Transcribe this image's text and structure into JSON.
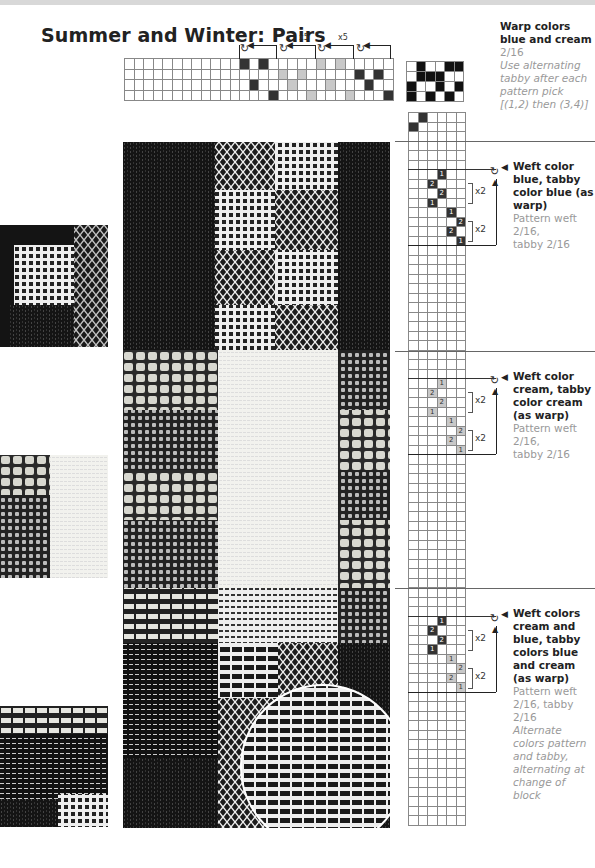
{
  "page": {
    "title": "Summer and Winter: Pairs"
  },
  "threading": {
    "repeat_labels": [
      "x5",
      "x5"
    ],
    "rows": 4,
    "columns": 28,
    "blocks": [
      {
        "start_col": 12,
        "color": "dark",
        "cells": [
          [
            0,
            0
          ],
          [
            0,
            2
          ],
          [
            2,
            1
          ],
          [
            3,
            3
          ]
        ]
      },
      {
        "start_col": 16,
        "color": "light",
        "cells": [
          [
            1,
            0
          ],
          [
            1,
            2
          ],
          [
            2,
            1
          ],
          [
            3,
            3
          ]
        ]
      },
      {
        "start_col": 20,
        "color": "light",
        "cells": [
          [
            0,
            0
          ],
          [
            0,
            2
          ],
          [
            2,
            1
          ],
          [
            3,
            3
          ]
        ]
      },
      {
        "start_col": 24,
        "color": "dark",
        "cells": [
          [
            1,
            0
          ],
          [
            1,
            2
          ],
          [
            2,
            1
          ],
          [
            3,
            3
          ]
        ]
      }
    ]
  },
  "tieup": {
    "cells": [
      [
        0,
        1
      ],
      [
        0,
        4
      ],
      [
        0,
        5
      ],
      [
        1,
        1
      ],
      [
        1,
        2
      ],
      [
        1,
        3
      ],
      [
        2,
        0
      ],
      [
        2,
        3
      ],
      [
        2,
        5
      ],
      [
        3,
        0
      ],
      [
        3,
        2
      ],
      [
        3,
        4
      ]
    ]
  },
  "warp_info": {
    "heading": "Warp colors blue and cream",
    "count": "2/16",
    "note": "Use alternating tabby after each pattern pick [(1,2) then (3,4)]"
  },
  "sections": [
    {
      "heading": "Weft color blue, tabby color blue (as warp)",
      "details": [
        "Pattern weft",
        "2/16,",
        "tabby 2/16"
      ],
      "note": "",
      "repeat_labels": [
        "x2",
        "x2"
      ],
      "treadle_numbers": [
        "1",
        "2",
        "2",
        "1",
        "1",
        "2",
        "2",
        "1"
      ],
      "treadle_color": "dark"
    },
    {
      "heading": "Weft color cream, tabby color cream (as warp)",
      "details": [
        "Pattern weft",
        "2/16,",
        "tabby 2/16"
      ],
      "note": "",
      "repeat_labels": [
        "x2",
        "x2"
      ],
      "treadle_numbers": [
        "1",
        "2",
        "2",
        "1",
        "1",
        "2",
        "2",
        "1"
      ],
      "treadle_color": "light"
    },
    {
      "heading": "Weft colors cream and blue, tabby colors blue and cream (as warp)",
      "details": [
        "Pattern weft",
        "2/16, tabby",
        "2/16"
      ],
      "note": "Alternate colors pattern and tabby, alternating at change of block",
      "repeat_labels": [
        "x2",
        "x2"
      ],
      "treadle_numbers": [
        "1",
        "2",
        "2",
        "1",
        "1",
        "2",
        "2",
        "1"
      ],
      "treadle_color": "mixed"
    }
  ],
  "colors": {
    "dark": "#1a1a1a",
    "light": "#c8c8c8",
    "grid": "#888888",
    "cream": "#eeeeea"
  }
}
